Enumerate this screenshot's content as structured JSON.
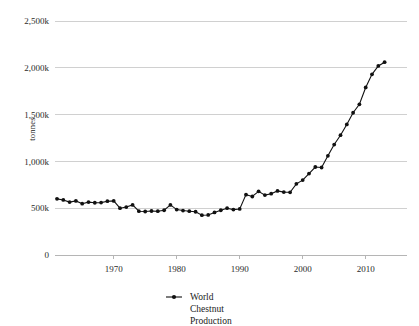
{
  "chart_data": {
    "type": "line",
    "title": "",
    "xlabel": "",
    "ylabel": "tonnes",
    "xlim": [
      1961,
      2013
    ],
    "ylim": [
      0,
      2500
    ],
    "grid": true,
    "y_unit": "thousand tonnes",
    "y_ticks": [
      0,
      500,
      1000,
      1500,
      2000,
      2500
    ],
    "y_tick_labels": [
      "0",
      "500k",
      "1,000k",
      "1,500k",
      "2,000k",
      "2,500k"
    ],
    "x_ticks": [
      1970,
      1980,
      1990,
      2000,
      2010
    ],
    "x_tick_labels": [
      "1970",
      "1980",
      "1990",
      "2000",
      "2010"
    ],
    "legend_position": "bottom-center",
    "series": [
      {
        "name": "World Chestnut Production",
        "name_lines": [
          "World",
          "Chestnut",
          "Production"
        ],
        "color": "#111111",
        "marker": "circle",
        "x": [
          1961,
          1962,
          1963,
          1964,
          1965,
          1966,
          1967,
          1968,
          1969,
          1970,
          1971,
          1972,
          1973,
          1974,
          1975,
          1976,
          1977,
          1978,
          1979,
          1980,
          1981,
          1982,
          1983,
          1984,
          1985,
          1986,
          1987,
          1988,
          1989,
          1990,
          1991,
          1992,
          1993,
          1994,
          1995,
          1996,
          1997,
          1998,
          1999,
          2000,
          2001,
          2002,
          2003,
          2004,
          2005,
          2006,
          2007,
          2008,
          2009,
          2010,
          2011,
          2012,
          2013
        ],
        "values": [
          600,
          588,
          565,
          578,
          548,
          565,
          558,
          560,
          575,
          578,
          500,
          512,
          535,
          468,
          465,
          470,
          468,
          478,
          535,
          485,
          475,
          468,
          462,
          425,
          428,
          455,
          478,
          500,
          485,
          492,
          645,
          625,
          680,
          640,
          655,
          685,
          672,
          670,
          760,
          800,
          870,
          940,
          935,
          1060,
          1180,
          1280,
          1395,
          1520,
          1610,
          1790,
          1930,
          2020,
          2060
        ],
        "unit": "thousand tonnes"
      }
    ]
  },
  "legend": {
    "line1": "World",
    "line2": "Chestnut",
    "line3": "Production"
  },
  "axis": {
    "y_title": "tonnes"
  }
}
